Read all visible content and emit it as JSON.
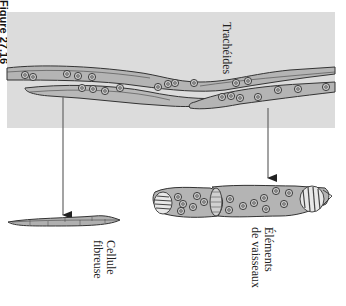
{
  "figure": {
    "label": "Figure 27.16"
  },
  "labels": {
    "tracheids": "Trachéides",
    "fiber_line1": "Cellule",
    "fiber_line2": "fibreuse",
    "vessel_line1": "Éléments",
    "vessel_line2": "de vaisseaux"
  },
  "colors": {
    "panel_bg": "#dcdcdc",
    "cell_fill": "#b4b4b4",
    "outline": "#333333",
    "arrow": "#555555"
  }
}
